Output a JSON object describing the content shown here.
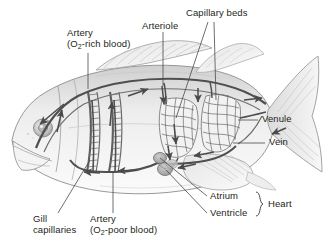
{
  "figure": {
    "background_color": "#ffffff",
    "text_color": "#231f20",
    "line_color": "#3a3a3a",
    "organism": "fish"
  },
  "labels": {
    "artery_rich_line1": "Artery",
    "artery_rich_line2_pre": "(O",
    "artery_rich_line2_sub": "2",
    "artery_rich_line2_post": "-rich blood)",
    "arteriole": "Arteriole",
    "capillary_beds": "Capillary beds",
    "venule": "Venule",
    "vein": "Vein",
    "atrium": "Atrium",
    "ventricle": "Ventricle",
    "heart": "Heart",
    "gill_line1": "Gill",
    "gill_line2": "capillaries",
    "artery_poor_line1": "Artery",
    "artery_poor_line2_pre": "(O",
    "artery_poor_line2_sub": "2",
    "artery_poor_line2_post": "-poor blood)"
  },
  "anatomy": {
    "parts": [
      "dorsal aorta",
      "gill capillaries",
      "ventral aorta",
      "heart atrium",
      "heart ventricle",
      "anterior capillary bed",
      "posterior capillary bed",
      "arteriole",
      "venule",
      "vein",
      "dorsal fin",
      "caudal fin",
      "pectoral fin",
      "eye",
      "mouth"
    ],
    "flow_direction_notes": [
      "blood flows forward along dorsal aorta toward head",
      "blood flows upward from gills into dorsal aorta",
      "blood descends through arteriole into capillary beds",
      "blood returns posteriorly through venule and vein to heart",
      "heart pumps blood forward into gill capillaries"
    ]
  }
}
